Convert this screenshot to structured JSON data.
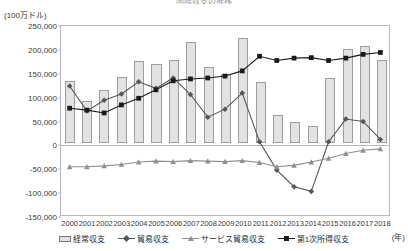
{
  "chart_title_clipped": "国際収支の推移",
  "unit_label": "(100万ドル)",
  "x_unit_label": "(年)",
  "colors": {
    "bar_fill": "#e2e2e2",
    "bar_stroke": "#9e9e9e",
    "trade_balance": "#555555",
    "service_trade_balance": "#909090",
    "primary_income": "#1a1a1a",
    "axis": "#b9b9b9"
  },
  "legend": {
    "items": [
      {
        "label": "経常収支",
        "marker": "bar"
      },
      {
        "label": "貿易収支",
        "marker": "diamond-line"
      },
      {
        "label": "サービス貿易収支",
        "marker": "triangle-line"
      },
      {
        "label": "第1次所得収支",
        "marker": "square-line"
      }
    ]
  },
  "chart_data": {
    "type": "bar",
    "title": "国際収支の推移",
    "xlabel": "(年)",
    "ylabel": "(100万ドル)",
    "ylim": [
      -150000,
      250000
    ],
    "ytick_step": 50000,
    "yticks": [
      250000,
      200000,
      150000,
      100000,
      50000,
      0,
      -50000,
      -100000,
      -150000
    ],
    "ytick_labels": [
      "250,000",
      "200,000",
      "150,000",
      "100,000",
      "50,000",
      "0",
      "-50,000",
      "-100,000",
      "-150,000"
    ],
    "grid": false,
    "legend_position": "bottom",
    "categories": [
      "2000",
      "2001",
      "2002",
      "2003",
      "2004",
      "2005",
      "2006",
      "2007",
      "2008",
      "2009",
      "2010",
      "2011",
      "2012",
      "2013",
      "2014",
      "2015",
      "2016",
      "2017",
      "2018"
    ],
    "series": [
      {
        "name": "経常収支",
        "type": "bar",
        "values": [
          130000,
          88000,
          112000,
          138000,
          172000,
          166000,
          175000,
          212000,
          160000,
          146000,
          221000,
          129000,
          60000,
          45000,
          36000,
          136000,
          197000,
          203000,
          175000
        ]
      },
      {
        "name": "貿易収支",
        "type": "line",
        "marker": "diamond",
        "values": [
          123000,
          70000,
          93000,
          106000,
          132000,
          118000,
          140000,
          105000,
          57000,
          74000,
          108000,
          5000,
          -55000,
          -90000,
          -100000,
          5000,
          53000,
          48000,
          10000
        ]
      },
      {
        "name": "サービス貿易収支",
        "type": "line",
        "marker": "triangle",
        "values": [
          -48000,
          -48000,
          -46000,
          -43000,
          -38000,
          -36000,
          -37000,
          -35000,
          -36000,
          -37000,
          -35000,
          -39000,
          -48000,
          -45000,
          -38000,
          -30000,
          -20000,
          -13000,
          -10000
        ]
      },
      {
        "name": "第1次所得収支",
        "type": "line",
        "marker": "square",
        "values": [
          76000,
          72000,
          66000,
          83000,
          97000,
          115000,
          134000,
          138000,
          140000,
          144000,
          155000,
          186000,
          177000,
          182000,
          183000,
          177000,
          182000,
          190000,
          194000
        ]
      }
    ]
  }
}
